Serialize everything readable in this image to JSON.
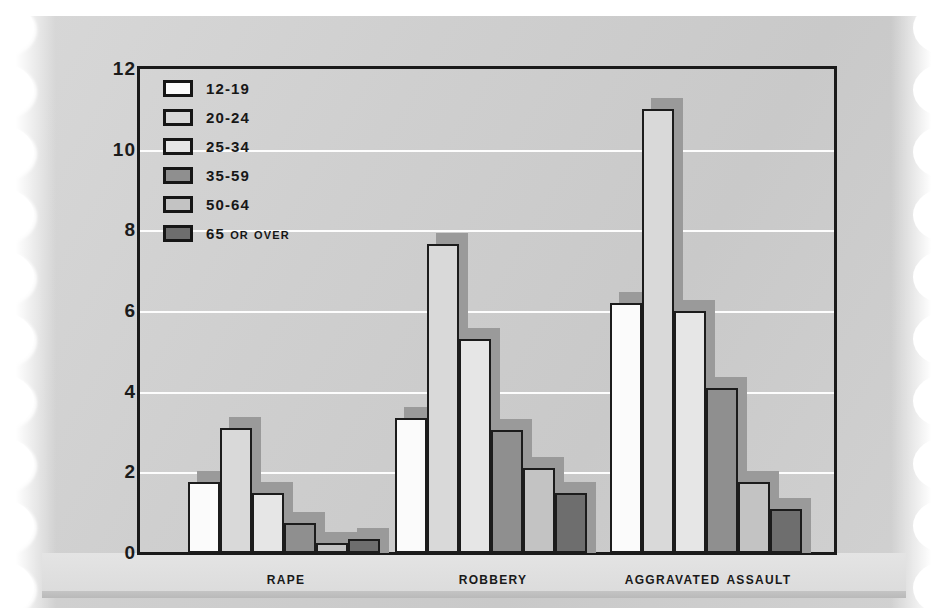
{
  "chart_data": {
    "type": "bar",
    "title": "",
    "xlabel": "",
    "ylabel": "",
    "ylim": [
      0,
      12
    ],
    "yticks": [
      0,
      2,
      4,
      6,
      8,
      10,
      12
    ],
    "grid": true,
    "legend_position": "top-left",
    "categories": [
      "Rape",
      "Robbery",
      "Aggravated assault"
    ],
    "series": [
      {
        "name": "12-19",
        "color": "#fbfbfb",
        "values": [
          1.75,
          3.35,
          6.2
        ]
      },
      {
        "name": "20-24",
        "color": "#d9d9d9",
        "values": [
          3.1,
          7.65,
          11.0
        ]
      },
      {
        "name": "25-34",
        "color": "#e6e6e6",
        "values": [
          1.5,
          5.3,
          6.0
        ]
      },
      {
        "name": "35-59",
        "color": "#8f8f8f",
        "values": [
          0.75,
          3.05,
          4.1
        ]
      },
      {
        "name": "50-64",
        "color": "#c3c3c3",
        "values": [
          0.25,
          2.1,
          1.75
        ]
      },
      {
        "name": "65 or over",
        "color": "#6e6e6e",
        "values": [
          0.35,
          1.5,
          1.1
        ]
      }
    ]
  },
  "legend": {
    "items": [
      {
        "label": "12-19"
      },
      {
        "label": "20-24"
      },
      {
        "label": "25-34"
      },
      {
        "label": "35-59"
      },
      {
        "label": "50-64"
      },
      {
        "label": "65 or over"
      }
    ]
  },
  "axis": {
    "y_tick_labels": [
      "12",
      "10",
      "8",
      "6",
      "4",
      "2",
      "0"
    ]
  },
  "x_labels": [
    "Rape",
    "Robbery",
    "Aggravated assault"
  ],
  "colors": {
    "frame": "#1a1a1a",
    "gridline": "#fdfdfd",
    "shadow": "#9a9a9a",
    "paper_light": "#d8d8d8",
    "paper_dark": "#c9c9c9"
  }
}
